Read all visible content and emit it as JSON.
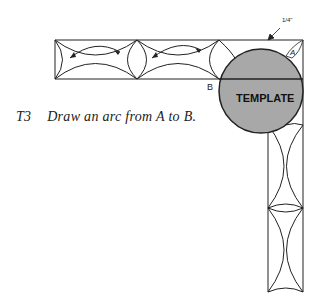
{
  "figure": {
    "step": "T3",
    "instruction": "Draw an arc from A to B.",
    "template_label": "TEMPLATE",
    "point_a": "A",
    "point_b": "B",
    "dimension": "1/4\"",
    "colors": {
      "ink": "#222222",
      "template_fill": "#a8a8a8",
      "background": "#ffffff"
    }
  }
}
